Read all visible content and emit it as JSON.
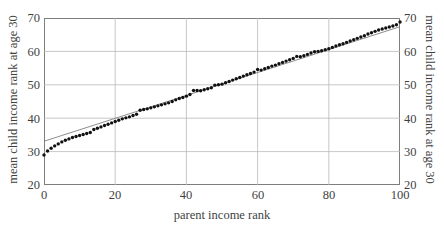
{
  "chart_data": {
    "type": "scatter",
    "title": "",
    "xlabel": "parent income rank",
    "ylabel": "mean child income rank at age 30",
    "ylabel_right": "mean child income rank at age 30",
    "xlim": [
      0,
      100
    ],
    "ylim": [
      20,
      70
    ],
    "xticks": [
      0,
      20,
      40,
      60,
      80,
      100
    ],
    "yticks": [
      20,
      30,
      40,
      50,
      60,
      70
    ],
    "grid": true,
    "grid_color": "#b9b9b9",
    "frame_color": "#7d7d7d",
    "series": [
      {
        "name": "mean child income rank",
        "style": "dotted-markers",
        "color": "#111111",
        "marker_size": 1.7,
        "x": [
          0,
          1,
          2,
          3,
          4,
          5,
          6,
          7,
          8,
          9,
          10,
          11,
          12,
          13,
          14,
          15,
          16,
          17,
          18,
          19,
          20,
          21,
          22,
          23,
          24,
          25,
          26,
          27,
          28,
          29,
          30,
          31,
          32,
          33,
          34,
          35,
          36,
          37,
          38,
          39,
          40,
          41,
          42,
          43,
          44,
          45,
          46,
          47,
          48,
          49,
          50,
          51,
          52,
          53,
          54,
          55,
          56,
          57,
          58,
          59,
          60,
          61,
          62,
          63,
          64,
          65,
          66,
          67,
          68,
          69,
          70,
          71,
          72,
          73,
          74,
          75,
          76,
          77,
          78,
          79,
          80,
          81,
          82,
          83,
          84,
          85,
          86,
          87,
          88,
          89,
          90,
          91,
          92,
          93,
          94,
          95,
          96,
          97,
          98,
          99,
          100
        ],
        "y": [
          29.0,
          30.2,
          31.0,
          31.7,
          32.3,
          32.9,
          33.4,
          33.8,
          34.2,
          34.5,
          34.8,
          35.1,
          35.4,
          35.7,
          36.6,
          37.0,
          37.4,
          37.8,
          38.2,
          38.6,
          39.0,
          39.4,
          39.8,
          40.1,
          40.4,
          40.8,
          41.2,
          42.4,
          42.6,
          42.8,
          43.1,
          43.4,
          43.7,
          44.0,
          44.3,
          44.6,
          45.0,
          45.5,
          45.9,
          46.2,
          46.6,
          47.1,
          48.3,
          48.3,
          48.2,
          48.5,
          48.8,
          49.1,
          49.9,
          50.0,
          50.2,
          50.6,
          51.0,
          51.4,
          51.8,
          52.2,
          52.6,
          53.0,
          53.4,
          53.8,
          54.6,
          54.4,
          54.8,
          55.2,
          55.6,
          55.9,
          56.3,
          56.7,
          57.1,
          57.5,
          57.9,
          58.5,
          58.4,
          58.7,
          59.1,
          59.5,
          59.9,
          60.0,
          60.2,
          60.5,
          60.8,
          61.2,
          61.6,
          62.0,
          62.3,
          62.7,
          63.1,
          63.5,
          63.9,
          64.3,
          64.7,
          65.2,
          65.6,
          66.0,
          66.4,
          66.7,
          67.0,
          67.3,
          67.6,
          68.0,
          68.8
        ]
      },
      {
        "name": "linear fit",
        "style": "line",
        "color": "#808080",
        "x": [
          0,
          100
        ],
        "y": [
          33.1,
          67.4
        ]
      }
    ]
  },
  "axes": {
    "x_title": "parent income rank",
    "y_title_left": "mean child income rank at age 30",
    "y_title_right": "mean child income rank at age 30",
    "x_tick_labels": [
      "0",
      "20",
      "40",
      "60",
      "80",
      "100"
    ],
    "y_tick_labels": [
      "70",
      "60",
      "50",
      "40",
      "30",
      "20"
    ]
  }
}
